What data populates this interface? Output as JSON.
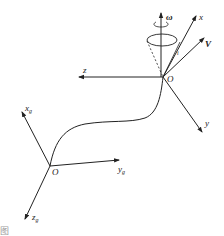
{
  "diagram": {
    "type": "coordinate-frames",
    "body_frame": {
      "origin_label": "O",
      "axes": [
        {
          "name": "x",
          "label": "x"
        },
        {
          "name": "y",
          "label": "y"
        },
        {
          "name": "z",
          "label": "z"
        }
      ],
      "velocity_label": "V",
      "angular_velocity_label": "ω",
      "angle_label": "i"
    },
    "ground_frame": {
      "origin_label": "O",
      "axes": [
        {
          "name": "xg",
          "label": "x",
          "subscript": "g"
        },
        {
          "name": "yg",
          "label": "y",
          "subscript": "g"
        },
        {
          "name": "zg",
          "label": "z",
          "subscript": "g"
        }
      ]
    },
    "caption": "图"
  }
}
